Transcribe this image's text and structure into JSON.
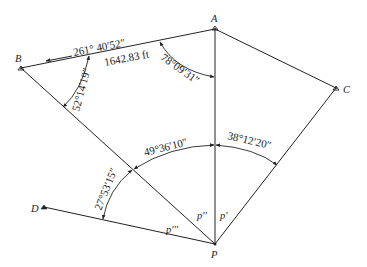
{
  "points": {
    "A": {
      "label": "A"
    },
    "B": {
      "label": "B"
    },
    "C": {
      "label": "C"
    },
    "D": {
      "label": "D"
    },
    "P": {
      "label": "P"
    }
  },
  "line_labels": {
    "p1": "p'",
    "p2": "p''",
    "p3": "p'''"
  },
  "bearing": {
    "label": "261° 40′52″",
    "direction": "toward B"
  },
  "distance": {
    "label": "1642.83 ft"
  },
  "angles": {
    "at_A": "78°09′31″",
    "at_B": "52°14′19″",
    "at_P_DB": "27°53′15″",
    "at_P_BA": "49°36′10″",
    "at_P_AC": "38°12′20″"
  }
}
